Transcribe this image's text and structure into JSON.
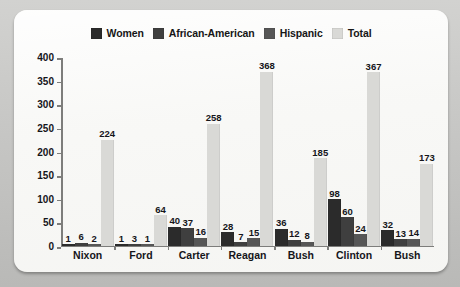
{
  "card": {
    "background_color": "#f7f7f5",
    "page_background_color": "#c9c9c7"
  },
  "chart_data": {
    "type": "bar",
    "title": "",
    "subtitle": "",
    "xlabel": "",
    "ylabel": "",
    "ylim": [
      0,
      400
    ],
    "ytick_step": 50,
    "ytick_labels": [
      "400",
      "350",
      "300",
      "250",
      "200",
      "150",
      "100",
      "50",
      "0"
    ],
    "ytick_values": [
      400,
      350,
      300,
      250,
      200,
      150,
      100,
      50,
      0
    ],
    "grid": false,
    "legend_position": "top-center",
    "categories": [
      "Nixon",
      "Ford",
      "Carter",
      "Reagan",
      "Bush",
      "Clinton",
      "Bush"
    ],
    "series": [
      {
        "name": "Women",
        "color": "#2b2b2b",
        "values": [
          1,
          1,
          40,
          28,
          36,
          98,
          32
        ]
      },
      {
        "name": "African-American",
        "color": "#3f3f3f",
        "values": [
          6,
          3,
          37,
          7,
          12,
          60,
          13
        ]
      },
      {
        "name": "Hispanic",
        "color": "#565656",
        "values": [
          2,
          1,
          16,
          15,
          8,
          24,
          14
        ]
      },
      {
        "name": "Total",
        "color": "#d9d9d6",
        "values": [
          224,
          64,
          258,
          368,
          185,
          367,
          173
        ]
      }
    ]
  },
  "axis": {
    "line_color": "#7d7d7b"
  }
}
